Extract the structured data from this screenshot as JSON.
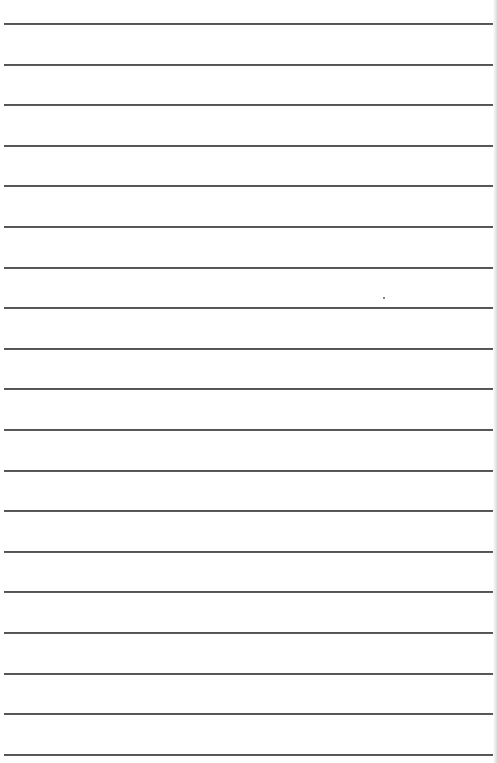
{
  "document": {
    "type": "lined-paper",
    "line_count": 19,
    "first_line_y": 24,
    "line_spacing_px": 40.6,
    "line_left_x": 4,
    "line_width_px": 490,
    "line_color": "#333333",
    "background_color": "#ffffff",
    "text_lines": [
      "",
      "",
      "",
      "",
      "",
      "",
      "",
      "",
      "",
      "",
      "",
      "",
      "",
      "",
      "",
      "",
      "",
      "",
      ""
    ],
    "speck": {
      "x": 383,
      "y": 297
    }
  }
}
